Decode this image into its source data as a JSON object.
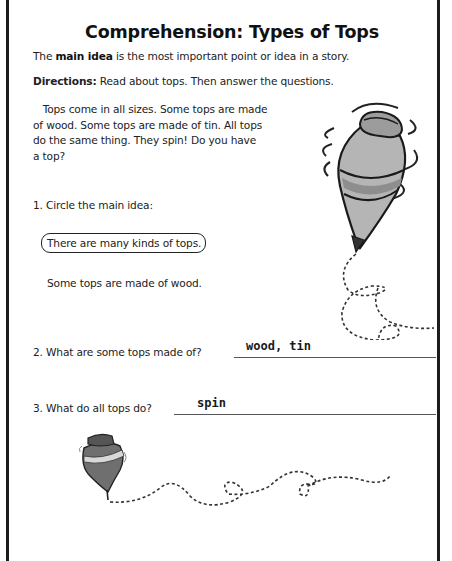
{
  "worksheet": {
    "title": "Comprehension: Types of Tops",
    "intro": {
      "prefix": "The ",
      "term": "main idea",
      "suffix": " is the most important point or idea in a story."
    },
    "directions": {
      "label": "Directions:",
      "text": " Read about tops. Then answer the questions."
    },
    "passage": {
      "lines": [
        "   Tops come in all sizes. Some tops are made",
        "of wood. Some tops are made of tin. All tops",
        "do the same thing. They spin! Do you have",
        "a top?"
      ]
    },
    "questions": [
      {
        "number": "1.",
        "prompt": "1. Circle the main idea:",
        "options": [
          {
            "text": "There are many kinds of tops.",
            "circled": true
          },
          {
            "text": "Some tops are made of wood.",
            "circled": false
          }
        ]
      },
      {
        "number": "2.",
        "prompt": "2. What are some tops made of?",
        "answer": "wood, tin"
      },
      {
        "number": "3.",
        "prompt": "3. What do all tops do?",
        "answer": "spin"
      }
    ],
    "illustrations": [
      {
        "name": "large-spinning-top",
        "icon": "spinning-top-icon"
      },
      {
        "name": "small-spinning-top",
        "icon": "spinning-top-icon"
      }
    ],
    "colors": {
      "border": "#1c1c1c",
      "text": "#222222",
      "top_fill_light": "#b8b8b8",
      "top_fill_dark": "#7a7a7a"
    }
  }
}
